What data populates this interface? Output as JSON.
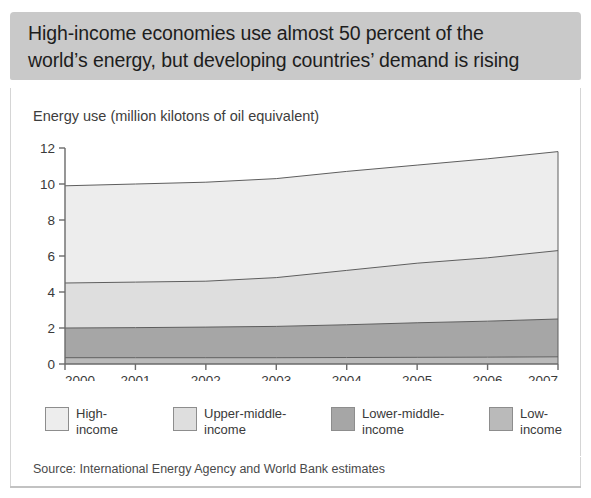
{
  "banner": {
    "line1": "High-income economies use almost 50 percent of the",
    "line2": "world’s energy, but developing countries’ demand is rising",
    "background": "#c9c9c9"
  },
  "figure": {
    "axis_title": "Energy use (million kilotons of oil equivalent)",
    "source": "Source: International Energy Agency and World Bank estimates"
  },
  "legend": {
    "items": [
      {
        "label_line1": "High-",
        "label_line2": "income",
        "color": "#ededed"
      },
      {
        "label_line1": "Upper-middle-",
        "label_line2": "income",
        "color": "#dedede"
      },
      {
        "label_line1": "Lower-middle-",
        "label_line2": "income",
        "color": "#a6a6a6"
      },
      {
        "label_line1": "Low-",
        "label_line2": "income",
        "color": "#bababa"
      }
    ]
  },
  "chart_data": {
    "type": "area",
    "stacked": true,
    "title": "Energy use (million kilotons of oil equivalent)",
    "xlabel": "",
    "ylabel": "Energy use (million kilotons of oil equivalent)",
    "categories": [
      "2000",
      "2001",
      "2002",
      "2003",
      "2004",
      "2005",
      "2006",
      "2007"
    ],
    "x": [
      2000,
      2001,
      2002,
      2003,
      2004,
      2005,
      2006,
      2007
    ],
    "xlim": [
      2000,
      2007
    ],
    "ylim": [
      0,
      12
    ],
    "yticks": [
      0,
      2,
      4,
      6,
      8,
      10,
      12
    ],
    "xticks": [
      2000,
      2001,
      2002,
      2003,
      2004,
      2005,
      2006,
      2007
    ],
    "grid": false,
    "legend_position": "below",
    "stack_order_bottom_to_top": [
      "Low-income",
      "Lower-middle-income",
      "Upper-middle-income",
      "High-income"
    ],
    "series": [
      {
        "name": "Low-income",
        "color": "#bababa",
        "values": [
          0.35,
          0.35,
          0.35,
          0.35,
          0.36,
          0.37,
          0.38,
          0.4
        ]
      },
      {
        "name": "Lower-middle-income",
        "color": "#a6a6a6",
        "values": [
          1.65,
          1.67,
          1.7,
          1.74,
          1.82,
          1.92,
          2.0,
          2.1
        ]
      },
      {
        "name": "Upper-middle-income",
        "color": "#dedede",
        "values": [
          2.5,
          2.53,
          2.55,
          2.71,
          3.02,
          3.31,
          3.52,
          3.8
        ]
      },
      {
        "name": "High-income",
        "color": "#ededed",
        "values": [
          5.4,
          5.45,
          5.5,
          5.5,
          5.5,
          5.45,
          5.5,
          5.5
        ]
      }
    ],
    "cumulative_tops": {
      "Low-income": [
        0.35,
        0.35,
        0.35,
        0.35,
        0.36,
        0.37,
        0.38,
        0.4
      ],
      "Lower-middle-income": [
        2.0,
        2.02,
        2.05,
        2.09,
        2.18,
        2.29,
        2.38,
        2.5
      ],
      "Upper-middle-income": [
        4.5,
        4.55,
        4.6,
        4.8,
        5.2,
        5.6,
        5.9,
        6.3
      ],
      "High-income": [
        9.9,
        10.0,
        10.1,
        10.3,
        10.7,
        11.05,
        11.4,
        11.8
      ]
    }
  }
}
